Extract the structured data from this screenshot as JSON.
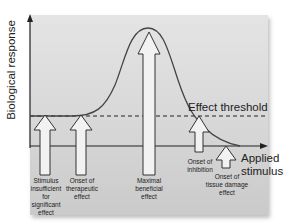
{
  "axes": {
    "y_label": "Biological response",
    "x_label_line1": "Applied",
    "x_label_line2": "stimulus"
  },
  "threshold": {
    "label": "Effect threshold"
  },
  "markers": [
    {
      "id": "insufficient",
      "lines": [
        "Stimulus",
        "insufficient",
        "for",
        "significant",
        "effect"
      ]
    },
    {
      "id": "onset-therapeutic",
      "lines": [
        "Onset of",
        "therapeutic",
        "effect"
      ]
    },
    {
      "id": "maximal-beneficial",
      "lines": [
        "Maximal",
        "beneficial",
        "effect"
      ]
    },
    {
      "id": "onset-inhibition",
      "lines": [
        "Onset of",
        "inhibition"
      ]
    },
    {
      "id": "onset-tissue-damage",
      "lines": [
        "Onset of",
        "tissue damage",
        "effect"
      ]
    }
  ],
  "colors": {
    "panel_top": "#e4e4e4",
    "panel_bottom": "#cacaca",
    "line": "#333333",
    "arrow_fill": "#f2f2f2"
  }
}
